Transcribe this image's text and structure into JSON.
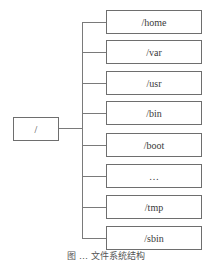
{
  "diagram": {
    "type": "tree",
    "root": {
      "label": "/"
    },
    "children": [
      {
        "label": "/home"
      },
      {
        "label": "/var"
      },
      {
        "label": "/usr"
      },
      {
        "label": "/bin"
      },
      {
        "label": "/boot"
      },
      {
        "label": "…"
      },
      {
        "label": "/tmp"
      },
      {
        "label": "/sbin"
      }
    ],
    "caption": "图 … 文件系统结构"
  }
}
